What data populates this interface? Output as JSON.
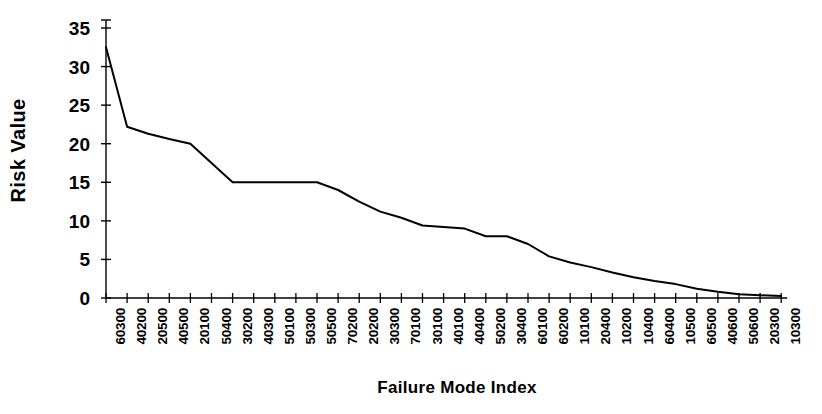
{
  "chart_data": {
    "type": "line",
    "title": "",
    "xlabel": "Failure Mode Index",
    "ylabel": "Risk Value",
    "ylim": [
      0,
      35
    ],
    "ytick_values": [
      0,
      5,
      10,
      15,
      20,
      25,
      30,
      35
    ],
    "ytick_labels": [
      "0",
      "5",
      "10",
      "15",
      "20",
      "25",
      "30",
      "35"
    ],
    "grid": false,
    "legend": false,
    "legend_position": "none",
    "line_color": "#000000",
    "background_color": "#ffffff",
    "categories": [
      "60300",
      "40200",
      "20500",
      "40500",
      "20100",
      "50400",
      "30200",
      "40300",
      "50100",
      "50300",
      "50500",
      "70200",
      "20200",
      "30300",
      "70100",
      "30100",
      "40100",
      "40400",
      "50200",
      "30400",
      "60100",
      "60200",
      "10100",
      "20400",
      "10200",
      "10400",
      "60400",
      "10500",
      "60500",
      "40600",
      "50600",
      "20300",
      "10300"
    ],
    "values": [
      32.5,
      22.2,
      21.3,
      20.6,
      20.0,
      17.5,
      15.0,
      15.0,
      15.0,
      15.0,
      15.0,
      14.0,
      12.5,
      11.2,
      10.4,
      9.4,
      9.2,
      9.0,
      8.0,
      8.0,
      7.0,
      5.4,
      4.6,
      4.0,
      3.3,
      2.7,
      2.2,
      1.8,
      1.2,
      0.8,
      0.5,
      0.35,
      0.25
    ],
    "series": [
      {
        "name": "Risk Value",
        "values": [
          32.5,
          22.2,
          21.3,
          20.6,
          20.0,
          17.5,
          15.0,
          15.0,
          15.0,
          15.0,
          15.0,
          14.0,
          12.5,
          11.2,
          10.4,
          9.4,
          9.2,
          9.0,
          8.0,
          8.0,
          7.0,
          5.4,
          4.6,
          4.0,
          3.3,
          2.7,
          2.2,
          1.8,
          1.2,
          0.8,
          0.5,
          0.35,
          0.25
        ]
      }
    ]
  }
}
